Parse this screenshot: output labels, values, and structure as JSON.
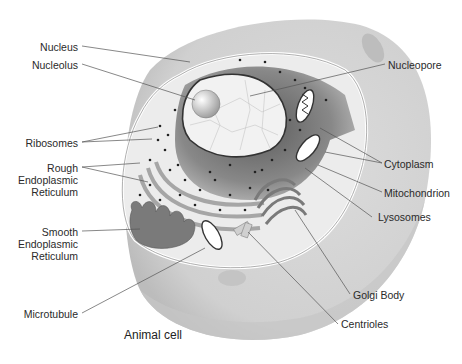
{
  "diagram": {
    "title": "Animal cell",
    "colors": {
      "outer_cell": "#d4d4d4",
      "outer_cell_shadow": "#c2c2c2",
      "cytoplasm": "#e9e9e9",
      "nucleus_dark": "#6e6e6e",
      "nucleus_mid": "#9a9a9a",
      "nucleoplasm": "#f3f3f3",
      "organelle": "#8a8a8a",
      "leader_line": "#555555",
      "text": "#2a2a2a"
    },
    "labels_left": [
      {
        "id": "nucleus",
        "text": "Nucleus"
      },
      {
        "id": "nucleolus",
        "text": "Nucleolus"
      },
      {
        "id": "ribosomes",
        "text": "Ribosomes"
      },
      {
        "id": "rough-er",
        "text": "Rough\nEndoplasmic\nReticulum"
      },
      {
        "id": "smooth-er",
        "text": "Smooth\nEndoplasmic\nReticulum"
      },
      {
        "id": "microtubule",
        "text": "Microtubule"
      }
    ],
    "labels_right": [
      {
        "id": "nucleopore",
        "text": "Nucleopore"
      },
      {
        "id": "cytoplasm",
        "text": "Cytoplasm"
      },
      {
        "id": "mitochondrion",
        "text": "Mitochondrion"
      },
      {
        "id": "lysosomes",
        "text": "Lysosomes"
      },
      {
        "id": "golgi-body",
        "text": "Golgi Body"
      },
      {
        "id": "centrioles",
        "text": "Centrioles"
      }
    ]
  }
}
